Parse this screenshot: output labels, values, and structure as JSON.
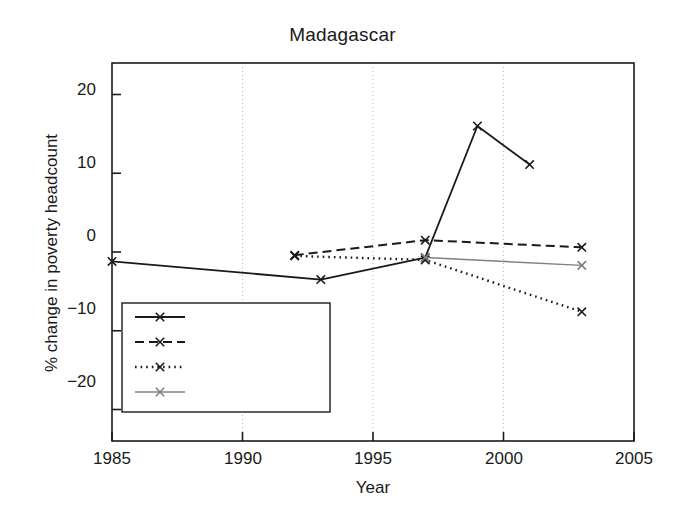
{
  "chart_data": {
    "type": "line",
    "title": "Madagascar",
    "xlabel": "Year",
    "ylabel": "% change in poverty headcount",
    "xlim": [
      1985,
      2005
    ],
    "ylim": [
      -24,
      24
    ],
    "xticks": [
      1985,
      1990,
      1995,
      2000,
      2005
    ],
    "yticks": [
      20,
      10,
      0,
      -10,
      -20
    ],
    "xtick_labels": [
      "1985",
      "1990",
      "1995",
      "2000",
      "2005"
    ],
    "ytick_labels": [
      "20",
      "10",
      "0",
      "−10",
      "−20"
    ],
    "grid": "vertical dotted gridlines at x ticks",
    "legend_position": "lower left",
    "series": [
      {
        "name": "Income",
        "style": "solid",
        "color": "#1a1a1a",
        "marker": "x",
        "x": [
          1985,
          1993,
          1997,
          1999,
          2001
        ],
        "y": [
          -1.2,
          -3.5,
          -0.7,
          16.0,
          11.1
        ]
      },
      {
        "name": "Education",
        "style": "dashed",
        "color": "#1a1a1a",
        "marker": "x",
        "x": [
          1992,
          1997,
          2003
        ],
        "y": [
          -0.4,
          1.5,
          0.6
        ]
      },
      {
        "name": "Health/Children",
        "style": "dotted",
        "color": "#1a1a1a",
        "marker": "x",
        "x": [
          1992,
          1997,
          2003
        ],
        "y": [
          -0.5,
          -1.0,
          -7.6
        ]
      },
      {
        "name": "Health/Women",
        "style": "solid-gray",
        "color": "#808080",
        "marker": "x",
        "x": [
          1997,
          2003
        ],
        "y": [
          -0.7,
          -1.7
        ]
      }
    ]
  },
  "legend": {
    "items": [
      {
        "label": "Income"
      },
      {
        "label": "Education"
      },
      {
        "label": "Health/Children"
      },
      {
        "label": "Health/Women"
      }
    ]
  }
}
